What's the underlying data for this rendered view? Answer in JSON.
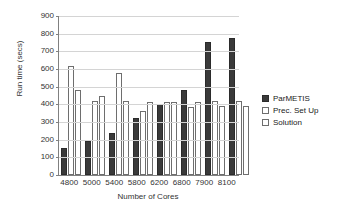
{
  "chart_data": {
    "type": "bar",
    "title": "",
    "xlabel": "Number of Cores",
    "ylabel": "Run time (secs)",
    "categories": [
      "4800",
      "5000",
      "5400",
      "5800",
      "6200",
      "6800",
      "7900",
      "8100"
    ],
    "series": [
      {
        "name": "ParMETIS",
        "values": [
          155,
          190,
          235,
          320,
          400,
          480,
          755,
          775
        ]
      },
      {
        "name": "Prec. Set Up",
        "values": [
          615,
          420,
          580,
          360,
          415,
          385,
          420,
          420
        ]
      },
      {
        "name": "Solution",
        "values": [
          480,
          445,
          420,
          415,
          415,
          415,
          390,
          390
        ]
      }
    ],
    "ylim": [
      0,
      900
    ],
    "ytick_step": 100,
    "yticks": [
      "900",
      "800",
      "700",
      "600",
      "500",
      "400",
      "300",
      "200",
      "100",
      "0"
    ],
    "grid": true,
    "legend_position": "right",
    "colors": {
      "parmetis": "#3a3a3a",
      "prec_set_up": "#ffffff",
      "solution": "#ffffff",
      "outline": "#6e6e6e",
      "grid": "#d4d4d4",
      "axis": "#808080"
    }
  }
}
